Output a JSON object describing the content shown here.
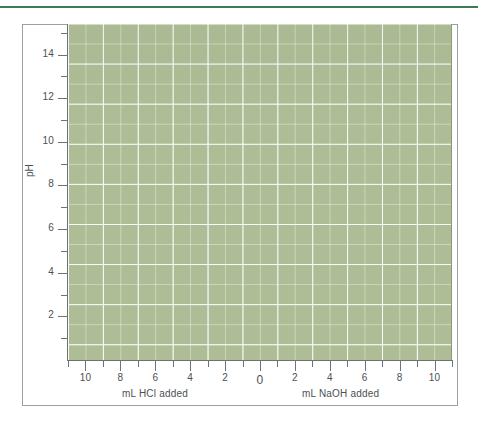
{
  "chart_data": {
    "type": "line",
    "title": "",
    "subtitle": "",
    "series": [],
    "x": [],
    "xlabel_left": "mL HCl added",
    "xlabel_right": "mL NaOH added",
    "ylabel": "pH",
    "xlim": [
      -11,
      11
    ],
    "ylim": [
      0,
      15.4
    ],
    "grid": true,
    "legend": null,
    "legend_position": "none",
    "x_major_ticks": [
      {
        "value": -10,
        "label": "10"
      },
      {
        "value": -8,
        "label": "8"
      },
      {
        "value": -6,
        "label": "6"
      },
      {
        "value": -4,
        "label": "4"
      },
      {
        "value": -2,
        "label": "2"
      },
      {
        "value": 0,
        "label": "0"
      },
      {
        "value": 2,
        "label": "2"
      },
      {
        "value": 4,
        "label": "4"
      },
      {
        "value": 6,
        "label": "6"
      },
      {
        "value": 8,
        "label": "8"
      },
      {
        "value": 10,
        "label": "10"
      }
    ],
    "x_minor_ticks": [
      -11,
      -9,
      -7,
      -5,
      -3,
      -1,
      1,
      3,
      5,
      7,
      9,
      11
    ],
    "y_major_ticks": [
      {
        "value": 2,
        "label": "2"
      },
      {
        "value": 4,
        "label": "4"
      },
      {
        "value": 6,
        "label": "6"
      },
      {
        "value": 8,
        "label": "8"
      },
      {
        "value": 10,
        "label": "10"
      },
      {
        "value": 12,
        "label": "12"
      },
      {
        "value": 14,
        "label": "14"
      }
    ],
    "y_minor_ticks": [
      1,
      3,
      5,
      7,
      9,
      11,
      13,
      15
    ],
    "colors": {
      "plot_fill": "#aebd96",
      "gridline": "#ffffff",
      "axis": "#6d7276",
      "text": "#4b5054",
      "frame": "#9aa0a3",
      "top_rule": "#3f7a55",
      "page_background": "#ffffff"
    }
  }
}
